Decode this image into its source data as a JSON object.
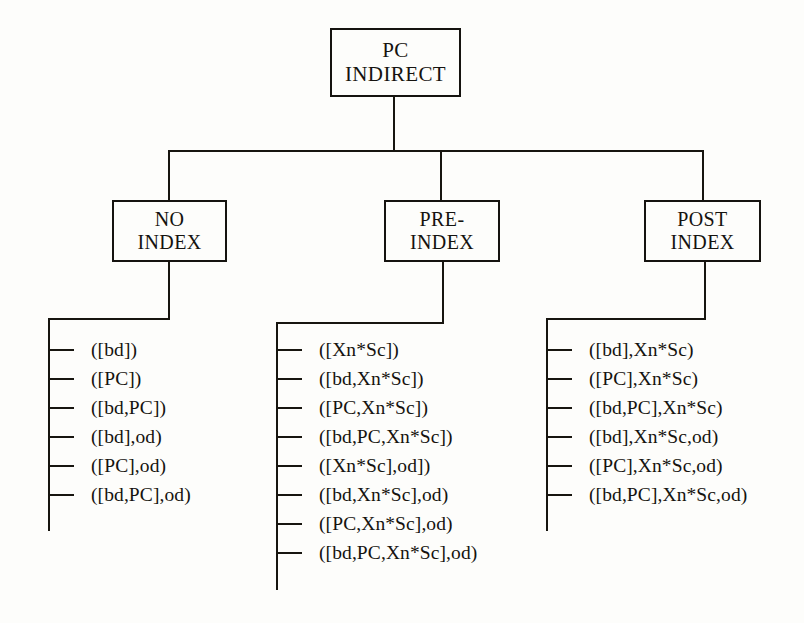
{
  "figure": {
    "kind": "tree-diagram",
    "background_color": "#fdfdfb",
    "line_color": "#17150f",
    "text_color": "#15130f"
  },
  "root": {
    "label_line1": "PC",
    "label_line2": "INDIRECT"
  },
  "branches": [
    {
      "id": "no-index",
      "label_line1": "NO",
      "label_line2": "INDEX",
      "leaves": [
        "([bd])",
        "([PC])",
        "([bd,PC])",
        "([bd],od)",
        "([PC],od)",
        "([bd,PC],od)"
      ]
    },
    {
      "id": "pre-index",
      "label_line1": "PRE-",
      "label_line2": "INDEX",
      "leaves": [
        "([Xn*Sc])",
        "([bd,Xn*Sc])",
        "([PC,Xn*Sc])",
        "([bd,PC,Xn*Sc])",
        "([Xn*Sc],od])",
        "([bd,Xn*Sc],od)",
        "([PC,Xn*Sc],od)",
        "([bd,PC,Xn*Sc],od)"
      ]
    },
    {
      "id": "post-index",
      "label_line1": "POST",
      "label_line2": "INDEX",
      "leaves": [
        "([bd],Xn*Sc)",
        "([PC],Xn*Sc)",
        "([bd,PC],Xn*Sc)",
        "([bd],Xn*Sc,od)",
        "([PC],Xn*Sc,od)",
        "([bd,PC],Xn*Sc,od)"
      ]
    }
  ]
}
